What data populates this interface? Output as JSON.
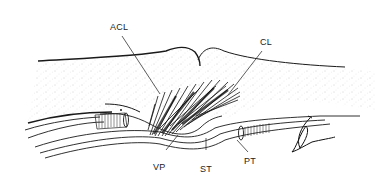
{
  "diagram": {
    "type": "anatomical-line-drawing",
    "labels": {
      "acl": "ACL",
      "cl": "CL",
      "vp": "VP",
      "st": "ST",
      "pt": "PT"
    },
    "colors": {
      "ink": "#1a1a1a",
      "stipple": "#8a8a8a",
      "background": "#ffffff"
    }
  }
}
